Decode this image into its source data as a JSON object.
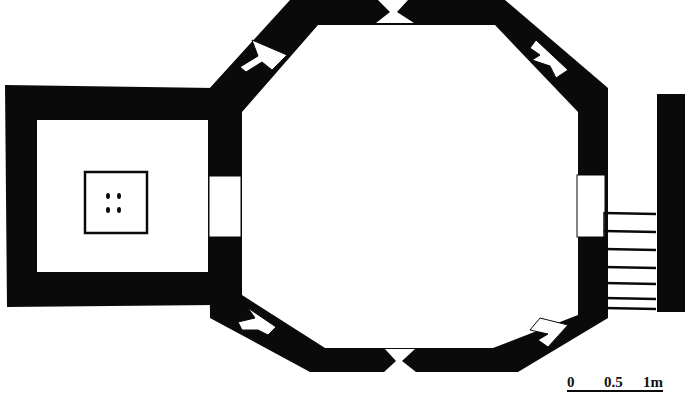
{
  "diagram": {
    "type": "architectural-floor-plan",
    "colors": {
      "wall": "#0a0a0a",
      "background": "#ffffff"
    },
    "elements": [
      "octagonal-hall",
      "square-annex",
      "annex-platform",
      "east-staircase",
      "east-wall-pier",
      "doorways",
      "diagonal-windows",
      "scale-bar"
    ],
    "stair": {
      "steps": 7
    },
    "platform": {
      "dots": 4
    },
    "scale_bar": {
      "labels": [
        "0",
        "0.5",
        "1m"
      ]
    }
  }
}
